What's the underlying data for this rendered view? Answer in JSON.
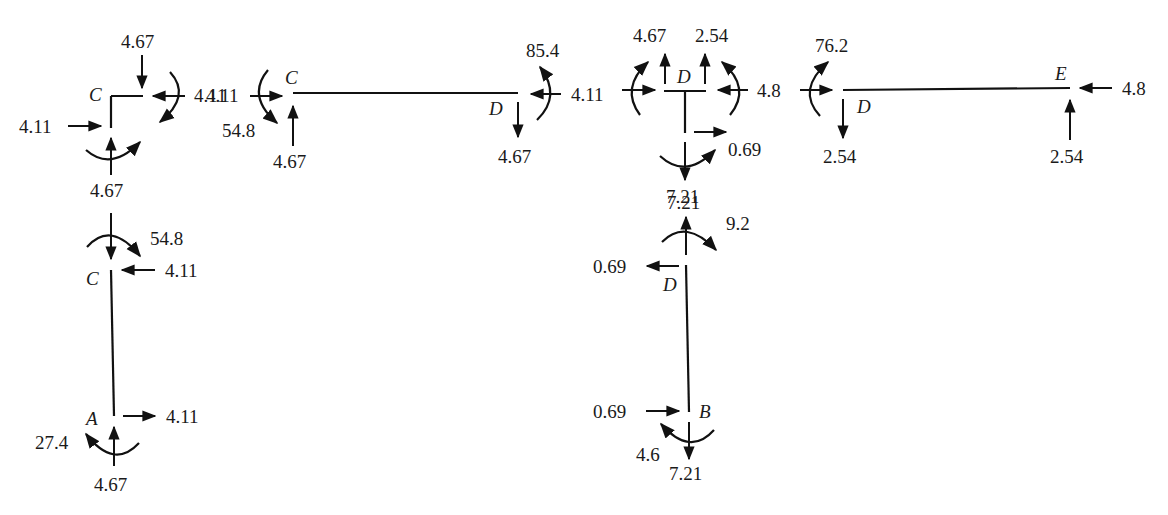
{
  "diagram": {
    "type": "free-body-diagram",
    "joints": {
      "C_joint": {
        "label": "C",
        "forces": {
          "top_down": "4.67",
          "right_left": "4.11",
          "left_right": "4.11",
          "bottom_up": "4.67"
        }
      },
      "member_CD": {
        "label_left": "C",
        "label_right": "D",
        "left_horizontal": "4.11",
        "left_moment": "54.8",
        "left_vertical": "4.67",
        "right_moment": "85.4",
        "right_vertical": "4.67",
        "right_horizontal": "4.11"
      },
      "D_joint": {
        "label": "D",
        "left_horizontal": "4.11",
        "up_left": "4.67",
        "up_right": "2.54",
        "right_horizontal": "4.8",
        "stem_horizontal": "0.69",
        "bottom_down": "7.21"
      },
      "member_DE": {
        "label_left": "D",
        "label_right": "E",
        "left_moment": "76.2",
        "left_horizontal": "4.8",
        "left_vertical": "2.54",
        "right_horizontal": "4.8",
        "right_vertical": "2.54"
      },
      "member_AC": {
        "label_top": "C",
        "label_bottom": "A",
        "top_vertical": "4.67",
        "top_moment": "54.8",
        "top_horizontal": "4.11",
        "bottom_horizontal": "4.11",
        "bottom_moment": "27.4",
        "bottom_vertical": "4.67"
      },
      "member_BD": {
        "label_top": "D",
        "label_bottom": "B",
        "top_vertical": "7.21",
        "top_moment": "9.2",
        "top_horizontal": "0.69",
        "bottom_horizontal": "0.69",
        "bottom_moment": "4.6",
        "bottom_vertical": "7.21"
      }
    }
  }
}
